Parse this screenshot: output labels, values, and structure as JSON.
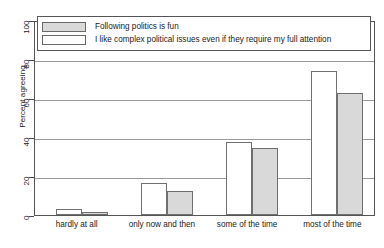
{
  "chart_data": {
    "type": "bar",
    "title": "",
    "xlabel": "",
    "ylabel": "Percent agreeing",
    "ylim": [
      0,
      100
    ],
    "yticks": [
      0,
      20,
      40,
      60,
      80,
      100
    ],
    "grid": "horizontal",
    "legend_position": "top-left-inside",
    "categories": [
      "hardly at all",
      "only now and then",
      "some of the time",
      "most of the time"
    ],
    "series": [
      {
        "name": "I like complex political issues even if they require my full attention",
        "style": "white",
        "values": [
          3,
          16.5,
          37.5,
          74
        ]
      },
      {
        "name": "Following politics is fun",
        "style": "gray",
        "values": [
          1.5,
          12.5,
          34.5,
          62.5
        ]
      }
    ],
    "legend_entries": [
      {
        "label": "Following politics is fun",
        "style": "gray"
      },
      {
        "label": "I like complex political issues even if they require my full attention",
        "style": "white"
      }
    ],
    "colors": {
      "series_gray_fill": "#d9d9d9",
      "series_white_fill": "#ffffff",
      "bar_outline": "#6a6a6a",
      "gridline": "#9a9a9a",
      "frame": "#555555",
      "text": "#1a1a1a",
      "background": "#ffffff"
    }
  }
}
